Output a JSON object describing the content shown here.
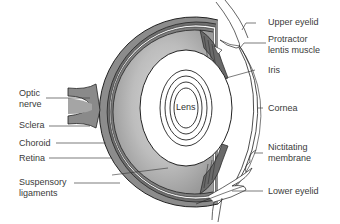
{
  "diagram": {
    "center_label": "Lens",
    "labels_left": [
      {
        "id": "optic-nerve",
        "line1": "Optic",
        "line2": "nerve"
      },
      {
        "id": "sclera",
        "line1": "Sclera"
      },
      {
        "id": "choroid",
        "line1": "Choroid"
      },
      {
        "id": "retina",
        "line1": "Retina"
      },
      {
        "id": "suspensory-ligaments",
        "line1": "Suspensory",
        "line2": "ligaments"
      }
    ],
    "labels_right": [
      {
        "id": "upper-eyelid",
        "line1": "Upper eyelid"
      },
      {
        "id": "protractor-lentis-muscle",
        "line1": "Protractor",
        "line2": "lentis muscle"
      },
      {
        "id": "iris",
        "line1": "Iris"
      },
      {
        "id": "cornea",
        "line1": "Cornea"
      },
      {
        "id": "nictitating-membrane",
        "line1": "Nictitating",
        "line2": "membrane"
      },
      {
        "id": "lower-eyelid",
        "line1": "Lower eyelid"
      }
    ],
    "colors": {
      "outline": "#222222",
      "sclera_fill": "#8a8a8a",
      "vitreous_fill": "#b8b8b8",
      "lens_fill": "#ffffff",
      "leader_line": "#444444"
    }
  }
}
